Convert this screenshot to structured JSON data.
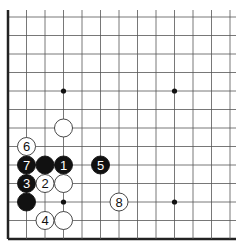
{
  "board": {
    "description": "Go board corner diagram (lower-left), 13 visible lines each way",
    "line_color": "#555555",
    "edge_color": "#222222",
    "background": "#ffffff",
    "columns": 13,
    "rows": 13,
    "left_edge": true,
    "bottom_edge": true,
    "star_points": [
      {
        "col": 3,
        "row": 4
      },
      {
        "col": 9,
        "row": 4
      },
      {
        "col": 3,
        "row": 10
      },
      {
        "col": 9,
        "row": 10
      }
    ]
  },
  "stones": [
    {
      "color": "white",
      "col": 3,
      "row": 6,
      "label": ""
    },
    {
      "color": "white",
      "col": 1,
      "row": 7,
      "label": "6"
    },
    {
      "color": "black",
      "col": 1,
      "row": 8,
      "label": "7"
    },
    {
      "color": "black",
      "col": 2,
      "row": 8,
      "label": ""
    },
    {
      "color": "black",
      "col": 3,
      "row": 8,
      "label": "1"
    },
    {
      "color": "black",
      "col": 5,
      "row": 8,
      "label": "5"
    },
    {
      "color": "black",
      "col": 1,
      "row": 9,
      "label": "3"
    },
    {
      "color": "white",
      "col": 2,
      "row": 9,
      "label": "2"
    },
    {
      "color": "white",
      "col": 3,
      "row": 9,
      "label": ""
    },
    {
      "color": "black",
      "col": 1,
      "row": 10,
      "label": ""
    },
    {
      "color": "white",
      "col": 6,
      "row": 10,
      "label": "8"
    },
    {
      "color": "white",
      "col": 2,
      "row": 11,
      "label": "4"
    },
    {
      "color": "white",
      "col": 3,
      "row": 11,
      "label": ""
    }
  ]
}
